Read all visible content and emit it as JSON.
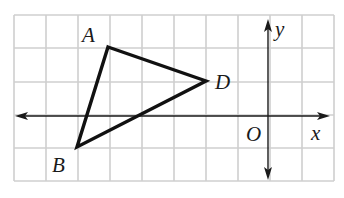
{
  "diagram": {
    "type": "coordinate-grid",
    "grid": {
      "columns": 10,
      "rows": 5,
      "x_range": [
        -8,
        2
      ],
      "y_range": [
        -2,
        3
      ],
      "line_color": "#cfcfcf"
    },
    "axes": {
      "x_label": "x",
      "y_label": "y",
      "origin_label": "O",
      "color": "#1a1a1a"
    },
    "triangle": {
      "stroke_color": "#111111",
      "vertices": [
        {
          "label": "A",
          "x": -5,
          "y": 2
        },
        {
          "label": "D",
          "x": -2,
          "y": 1
        },
        {
          "label": "B",
          "x": -6,
          "y": -1
        }
      ]
    }
  }
}
